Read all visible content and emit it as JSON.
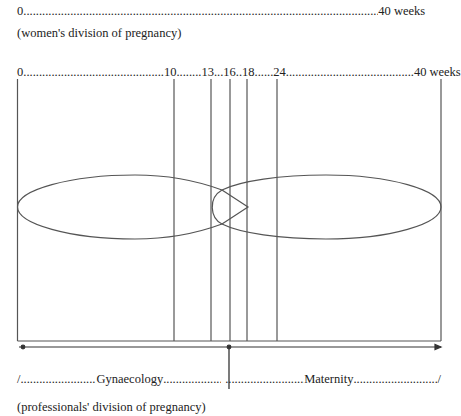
{
  "top_scale": {
    "start": "0",
    "end": "40 weeks",
    "dots_text": ".........................................................................................................................................",
    "caption": "(women's division of pregnancy)"
  },
  "professional_scale": {
    "ticks": [
      {
        "label": "0",
        "week": 0
      },
      {
        "label": "10",
        "week": 10
      },
      {
        "label": "13",
        "week": 13
      },
      {
        "label": "16",
        "week": 16
      },
      {
        "label": "18",
        "week": 18
      },
      {
        "label": "24",
        "week": 24
      },
      {
        "label": "40 weeks",
        "week": 40
      }
    ],
    "scale_text": "0.............................................10........13...16..18......24.........................................40 weeks"
  },
  "diagram": {
    "left_region": "Gynaecology",
    "right_region": "Maternity"
  },
  "bottom_labels": {
    "start_mark": "/",
    "left_dots": "..........................",
    "left_label": "Gynaecology",
    "mid_dots_left": "........................",
    "mid_dots_right": "..........................",
    "right_label": "Maternity",
    "right_dots": "..............................",
    "end_mark": "/",
    "caption": "(professionals' division of pregnancy)"
  },
  "colors": {
    "line": "#555555",
    "text": "#222222"
  }
}
